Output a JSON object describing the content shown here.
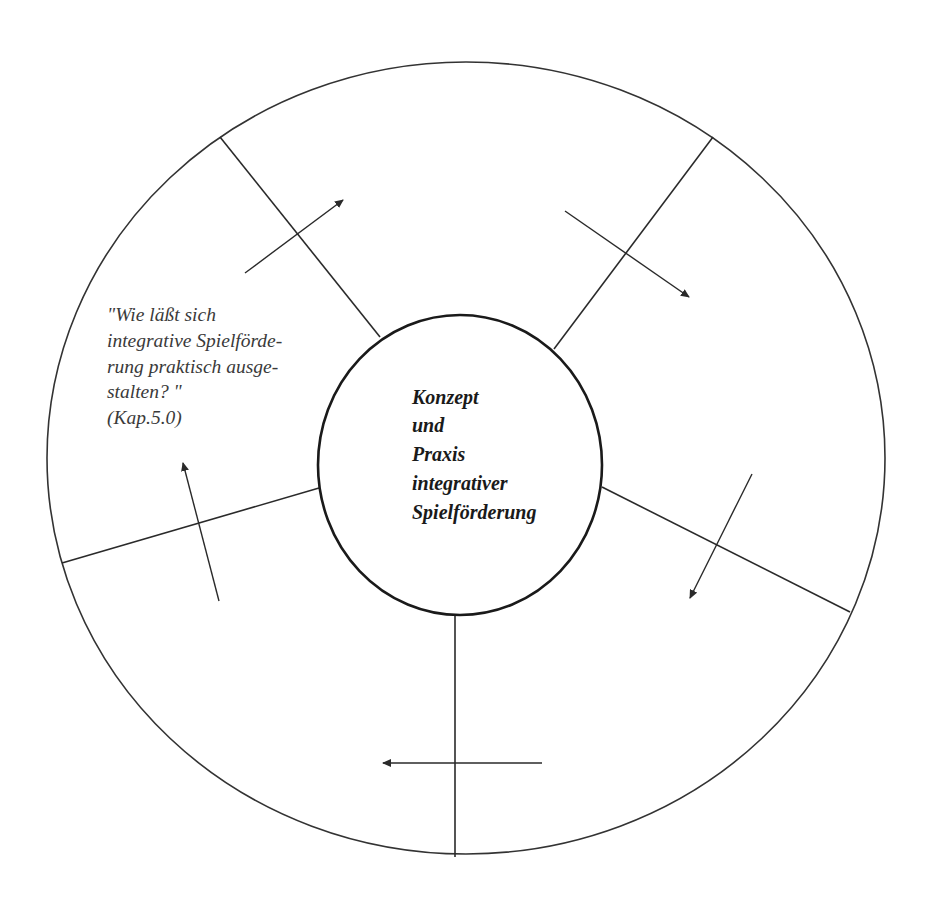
{
  "diagram": {
    "center": {
      "lines": [
        "Konzept",
        "und",
        "Praxis",
        "integrativer",
        "Spielförderung"
      ]
    },
    "segments": [
      {
        "position": "left",
        "question_lines": [
          "\"Wie läßt sich",
          "integrative Spielförde-",
          "rung praktisch ausge-",
          "stalten? \"",
          "(Kap.5.0)"
        ]
      }
    ],
    "colors": {
      "line": "#2a2a2a",
      "text": "#3a3a3a",
      "background": "#ffffff"
    }
  }
}
